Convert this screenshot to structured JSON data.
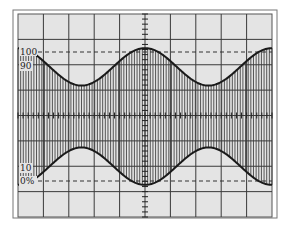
{
  "chart_data": {
    "type": "line",
    "title": "",
    "subtitle": "",
    "xlabel": "",
    "ylabel": "",
    "grid": true,
    "grid_divisions": {
      "x": 10,
      "y": 8
    },
    "axis_labels": [
      "100",
      "90",
      "10",
      "0%"
    ],
    "reference_lines": [
      {
        "label": "100",
        "style": "dashed",
        "level_pct": 100
      },
      {
        "label": "0%",
        "style": "dashed",
        "level_pct": 0
      }
    ],
    "envelope": {
      "cycles": 2,
      "phase_at_left": "maximum",
      "top_max_pct": 103,
      "top_min_pct": 74,
      "bottom_max_pct": 26,
      "bottom_min_pct": -3,
      "x": [
        0,
        0.125,
        0.25,
        0.375,
        0.5,
        0.625,
        0.75,
        0.875,
        1.0
      ],
      "top": [
        103,
        88.5,
        74,
        88.5,
        103,
        88.5,
        74,
        88.5,
        103
      ],
      "bottom": [
        -3,
        11.5,
        26,
        11.5,
        -3,
        11.5,
        26,
        11.5,
        -3
      ]
    },
    "carrier_line_count": 96,
    "colors": {
      "background": "#e4e4e4",
      "grid": "#3a3a3a",
      "envelope": "#1a1a1a",
      "carrier": "#444444",
      "frame": "#555555"
    }
  },
  "labels": {
    "l100": "100",
    "l90": "90",
    "l10": "10",
    "l0": "0%"
  }
}
